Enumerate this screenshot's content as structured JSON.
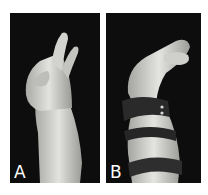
{
  "figure": {
    "panels": [
      {
        "label": "A",
        "description": "Hand with flexed fingers, no orthosis"
      },
      {
        "label": "B",
        "description": "Hand wearing dark wrist/forearm orthosis straps"
      }
    ],
    "colors": {
      "background": "#ffffff",
      "panel_background": "#0d0d0d",
      "skin": "#d8d8d4",
      "strap": "#2a2a2a",
      "label": "#ffffff"
    }
  }
}
